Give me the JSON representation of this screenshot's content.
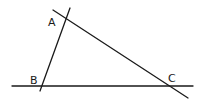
{
  "diagram": {
    "type": "triangle-from-lines",
    "background": "#ffffff",
    "stroke_color": "#1a1a1a",
    "lines": [
      {
        "id": "line-ab",
        "x1": 70,
        "y1": 8,
        "x2": 40,
        "y2": 91
      },
      {
        "id": "line-ac",
        "x1": 53,
        "y1": 10,
        "x2": 188,
        "y2": 98
      },
      {
        "id": "line-bc",
        "x1": 12,
        "y1": 86,
        "x2": 193,
        "y2": 86
      }
    ],
    "vertices": [
      {
        "name": "A",
        "x": 66,
        "y": 19,
        "label_x": 48,
        "label_y": 26
      },
      {
        "name": "B",
        "x": 41,
        "y": 86,
        "label_x": 30,
        "label_y": 84
      },
      {
        "name": "C",
        "x": 170,
        "y": 86,
        "label_x": 168,
        "label_y": 82
      }
    ]
  }
}
